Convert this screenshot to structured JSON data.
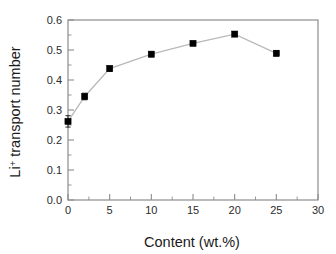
{
  "chart_data": {
    "type": "scatter",
    "title": "",
    "xlabel": "Content (wt.%)",
    "ylabel": "Li+ transport number",
    "ylabel_base": "Li",
    "ylabel_superscript": "+",
    "ylabel_rest": " transport number",
    "xlim": [
      0,
      30
    ],
    "ylim": [
      0.0,
      0.6
    ],
    "grid": false,
    "legend": null,
    "xticks": [
      0,
      5,
      10,
      15,
      20,
      25,
      30
    ],
    "xticklabels": [
      "0",
      "5",
      "10",
      "15",
      "20",
      "25",
      "30"
    ],
    "yticks": [
      0.0,
      0.1,
      0.2,
      0.3,
      0.4,
      0.5,
      0.6
    ],
    "yticklabels": [
      "0.0",
      "0.1",
      "0.2",
      "0.3",
      "0.4",
      "0.5",
      "0.6"
    ],
    "x": [
      0,
      2,
      5,
      10,
      15,
      20,
      25
    ],
    "values": [
      0.262,
      0.345,
      0.438,
      0.486,
      0.522,
      0.553,
      0.489
    ],
    "yerr": [
      0.019,
      0.011,
      0.009,
      0.008,
      0.007,
      0.006,
      0.009
    ],
    "marker": "square",
    "marker_color": "#000000",
    "line_color": "#b9b9b9",
    "background": "#ffffff",
    "frame_color": "#8c8c8c"
  }
}
